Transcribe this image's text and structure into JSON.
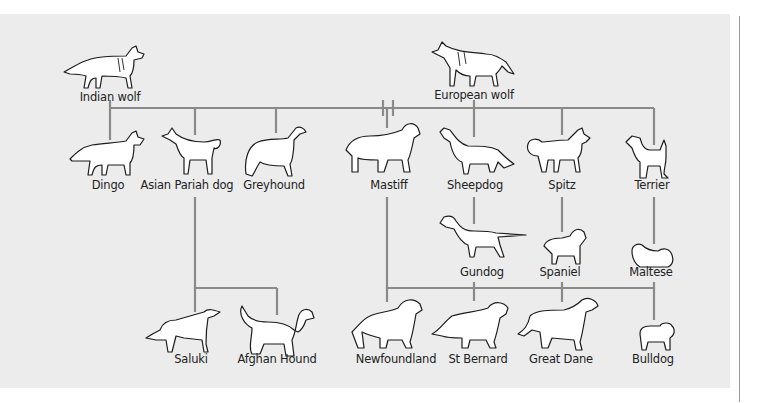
{
  "diagram": {
    "type": "dog-breed-ancestry-tree",
    "colors": {
      "panel_background": "#ececec",
      "connector_lines": "#8a8a8a",
      "illustration_ink": "#1c1c1c",
      "label_text": "#222222"
    },
    "ancestors": [
      {
        "id": "indian_wolf",
        "label": "Indian wolf"
      },
      {
        "id": "european_wolf",
        "label": "European wolf"
      }
    ],
    "first_generation": [
      {
        "id": "dingo",
        "label": "Dingo"
      },
      {
        "id": "asian_pariah_dog",
        "label": "Asian Pariah dog"
      },
      {
        "id": "greyhound",
        "label": "Greyhound"
      },
      {
        "id": "mastiff",
        "label": "Mastiff"
      },
      {
        "id": "sheepdog",
        "label": "Sheepdog"
      },
      {
        "id": "spitz",
        "label": "Spitz"
      },
      {
        "id": "terrier",
        "label": "Terrier"
      }
    ],
    "second_generation": [
      {
        "id": "gundog",
        "label": "Gundog"
      },
      {
        "id": "spaniel",
        "label": "Spaniel"
      },
      {
        "id": "maltese",
        "label": "Maltese"
      }
    ],
    "third_generation": [
      {
        "id": "saluki",
        "label": "Saluki"
      },
      {
        "id": "afghan_hound",
        "label": "Afghan Hound"
      },
      {
        "id": "newfoundland",
        "label": "Newfoundland"
      },
      {
        "id": "st_bernard",
        "label": "St Bernard"
      },
      {
        "id": "great_dane",
        "label": "Great Dane"
      },
      {
        "id": "bulldog",
        "label": "Bulldog"
      }
    ],
    "connections": [
      {
        "from": [
          "Indian wolf",
          "European wolf"
        ],
        "to": [
          "Dingo",
          "Asian Pariah dog",
          "Greyhound",
          "Mastiff",
          "Sheepdog",
          "Spitz",
          "Terrier"
        ]
      },
      {
        "from": [
          "Sheepdog"
        ],
        "to": [
          "Gundog"
        ]
      },
      {
        "from": [
          "Spitz"
        ],
        "to": [
          "Spaniel"
        ]
      },
      {
        "from": [
          "Terrier"
        ],
        "to": [
          "Maltese"
        ]
      },
      {
        "from": [
          "Asian Pariah dog",
          "Greyhound"
        ],
        "to": [
          "Saluki",
          "Afghan Hound"
        ]
      },
      {
        "from": [
          "Mastiff",
          "Gundog",
          "Spaniel",
          "Maltese"
        ],
        "to": [
          "Newfoundland",
          "St Bernard",
          "Great Dane",
          "Bulldog"
        ]
      }
    ]
  }
}
